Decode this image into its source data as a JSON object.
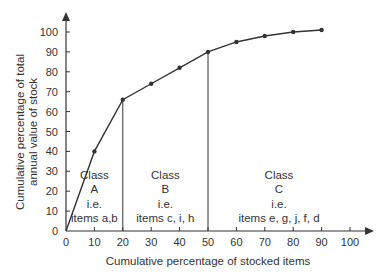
{
  "chart_data": {
    "type": "line",
    "title": "",
    "xlabel": "Cumulative percentage of stocked items",
    "ylabel": [
      "Cumulative percentage of total",
      "annual value of stock"
    ],
    "x": [
      0,
      10,
      20,
      30,
      40,
      50,
      60,
      70,
      80,
      90
    ],
    "values": [
      0,
      40,
      66,
      74,
      82,
      90,
      95,
      98,
      100,
      101
    ],
    "xticks": [
      0,
      10,
      20,
      30,
      40,
      50,
      60,
      70,
      80,
      90,
      100
    ],
    "yticks": [
      0,
      10,
      20,
      30,
      40,
      50,
      60,
      70,
      80,
      90,
      100
    ],
    "xlim": [
      0,
      100
    ],
    "ylim": [
      0,
      100
    ],
    "grid": false,
    "boundaries": [
      20,
      50
    ],
    "annotations": [
      {
        "lines": [
          "Class",
          "A",
          "i.e.",
          "items a,b"
        ],
        "x_center": 10
      },
      {
        "lines": [
          "Class",
          "B",
          "i.e.",
          "items c, i, h"
        ],
        "x_center": 35
      },
      {
        "lines": [
          "Class",
          "C",
          "i.e.",
          "items e, g, j, f, d"
        ],
        "x_center": 75
      }
    ]
  },
  "colors": {
    "line": "#333333",
    "axis": "#333333",
    "text": "#333333"
  }
}
